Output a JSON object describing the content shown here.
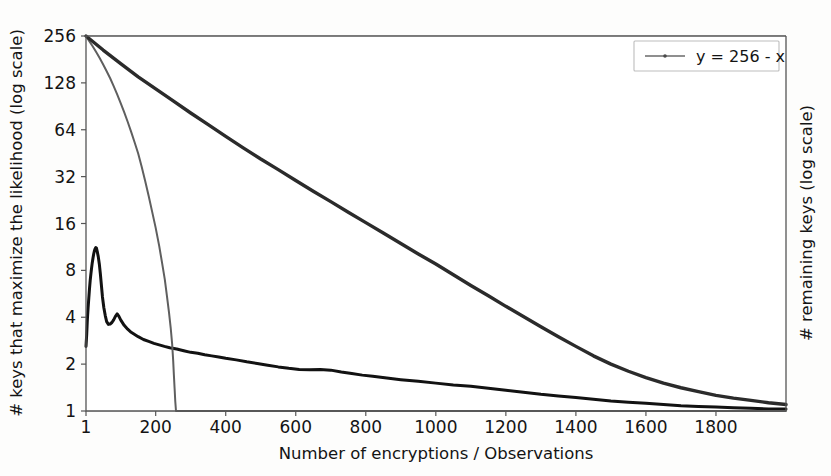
{
  "chart_data": {
    "type": "line",
    "title": "",
    "xlabel": "Number of encryptions / Observations",
    "ylabel_left": "# keys that maximize the likelihood (log scale)",
    "ylabel_right": "# remaining keys (log scale)",
    "xlim": [
      1,
      2000
    ],
    "ylim": [
      1,
      256
    ],
    "yscale": "log2",
    "xticks": [
      1,
      200,
      400,
      600,
      800,
      1000,
      1200,
      1400,
      1600,
      1800
    ],
    "xticklabels": [
      "1",
      "200",
      "400",
      "600",
      "800",
      "1000",
      "1200",
      "1400",
      "1600",
      "1800"
    ],
    "yticks": [
      1,
      2,
      4,
      8,
      16,
      32,
      64,
      128,
      256
    ],
    "yticklabels": [
      "1",
      "2",
      "4",
      "8",
      "16",
      "32",
      "64",
      "128",
      "256"
    ],
    "grid": true,
    "legend_position": "upper right",
    "legend": [
      {
        "label": "y = 256 - x",
        "color": "#6a6a6a",
        "marker": "line-with-dot"
      }
    ],
    "series": [
      {
        "name": "# keys that maximize the likelihood",
        "color": "#121212",
        "axis": "left",
        "points": [
          [
            1,
            2.6
          ],
          [
            3,
            3.1
          ],
          [
            5,
            3.9
          ],
          [
            7,
            4.6
          ],
          [
            9,
            5.3
          ],
          [
            11,
            6.1
          ],
          [
            13,
            6.9
          ],
          [
            15,
            7.6
          ],
          [
            17,
            8.3
          ],
          [
            19,
            9.0
          ],
          [
            21,
            9.6
          ],
          [
            23,
            10.2
          ],
          [
            25,
            10.7
          ],
          [
            27,
            11.0
          ],
          [
            29,
            11.2
          ],
          [
            31,
            11.1
          ],
          [
            33,
            10.6
          ],
          [
            36,
            9.8
          ],
          [
            39,
            8.8
          ],
          [
            42,
            7.6
          ],
          [
            45,
            6.4
          ],
          [
            48,
            5.4
          ],
          [
            52,
            4.6
          ],
          [
            56,
            4.1
          ],
          [
            60,
            3.75
          ],
          [
            65,
            3.6
          ],
          [
            70,
            3.62
          ],
          [
            75,
            3.7
          ],
          [
            80,
            3.85
          ],
          [
            85,
            4.05
          ],
          [
            90,
            4.2
          ],
          [
            95,
            4.05
          ],
          [
            100,
            3.85
          ],
          [
            110,
            3.55
          ],
          [
            120,
            3.35
          ],
          [
            130,
            3.2
          ],
          [
            140,
            3.1
          ],
          [
            150,
            3.0
          ],
          [
            165,
            2.88
          ],
          [
            180,
            2.8
          ],
          [
            195,
            2.72
          ],
          [
            210,
            2.66
          ],
          [
            225,
            2.6
          ],
          [
            240,
            2.55
          ],
          [
            260,
            2.5
          ],
          [
            280,
            2.44
          ],
          [
            300,
            2.38
          ],
          [
            320,
            2.35
          ],
          [
            340,
            2.3
          ],
          [
            360,
            2.26
          ],
          [
            380,
            2.22
          ],
          [
            400,
            2.18
          ],
          [
            430,
            2.13
          ],
          [
            460,
            2.07
          ],
          [
            490,
            2.02
          ],
          [
            520,
            1.97
          ],
          [
            550,
            1.92
          ],
          [
            580,
            1.88
          ],
          [
            610,
            1.85
          ],
          [
            640,
            1.84
          ],
          [
            670,
            1.85
          ],
          [
            700,
            1.83
          ],
          [
            730,
            1.78
          ],
          [
            760,
            1.74
          ],
          [
            790,
            1.7
          ],
          [
            820,
            1.67
          ],
          [
            860,
            1.63
          ],
          [
            900,
            1.59
          ],
          [
            950,
            1.55
          ],
          [
            1000,
            1.51
          ],
          [
            1050,
            1.47
          ],
          [
            1100,
            1.44
          ],
          [
            1150,
            1.4
          ],
          [
            1200,
            1.36
          ],
          [
            1250,
            1.32
          ],
          [
            1300,
            1.28
          ],
          [
            1350,
            1.25
          ],
          [
            1400,
            1.22
          ],
          [
            1450,
            1.19
          ],
          [
            1500,
            1.16
          ],
          [
            1550,
            1.14
          ],
          [
            1600,
            1.12
          ],
          [
            1650,
            1.1
          ],
          [
            1700,
            1.08
          ],
          [
            1750,
            1.07
          ],
          [
            1800,
            1.06
          ],
          [
            1850,
            1.05
          ],
          [
            1900,
            1.04
          ],
          [
            1950,
            1.03
          ],
          [
            2000,
            1.03
          ]
        ]
      },
      {
        "name": "# remaining keys",
        "color": "#6a6a6a",
        "axis": "right",
        "points": [
          [
            1,
            256
          ],
          [
            10,
            238
          ],
          [
            20,
            220
          ],
          [
            30,
            202
          ],
          [
            40,
            185
          ],
          [
            50,
            168
          ],
          [
            60,
            152
          ],
          [
            70,
            137
          ],
          [
            80,
            122
          ],
          [
            90,
            108
          ],
          [
            100,
            95
          ],
          [
            110,
            83
          ],
          [
            120,
            72
          ],
          [
            130,
            62
          ],
          [
            140,
            53
          ],
          [
            150,
            45
          ],
          [
            160,
            37
          ],
          [
            170,
            30
          ],
          [
            180,
            24
          ],
          [
            190,
            19
          ],
          [
            200,
            15
          ],
          [
            210,
            11.5
          ],
          [
            218,
            9.0
          ],
          [
            226,
            7.0
          ],
          [
            232,
            5.5
          ],
          [
            238,
            4.3
          ],
          [
            243,
            3.4
          ],
          [
            247,
            2.7
          ],
          [
            250,
            2.1
          ],
          [
            252,
            1.7
          ],
          [
            254,
            1.4
          ],
          [
            256,
            1.15
          ],
          [
            258,
            1.0
          ],
          [
            2000,
            1.0
          ]
        ]
      },
      {
        "name": "256 - x trend (dark)",
        "color": "#2b2b2b",
        "axis": "right",
        "points": [
          [
            1,
            256
          ],
          [
            50,
            208
          ],
          [
            100,
            170
          ],
          [
            150,
            140
          ],
          [
            200,
            117
          ],
          [
            250,
            98
          ],
          [
            300,
            82
          ],
          [
            350,
            69
          ],
          [
            400,
            58
          ],
          [
            450,
            49
          ],
          [
            500,
            41.5
          ],
          [
            550,
            35.5
          ],
          [
            600,
            30.2
          ],
          [
            650,
            25.8
          ],
          [
            700,
            22.1
          ],
          [
            750,
            18.9
          ],
          [
            800,
            16.2
          ],
          [
            850,
            13.9
          ],
          [
            900,
            11.9
          ],
          [
            950,
            10.2
          ],
          [
            1000,
            8.8
          ],
          [
            1050,
            7.5
          ],
          [
            1100,
            6.4
          ],
          [
            1150,
            5.5
          ],
          [
            1200,
            4.7
          ],
          [
            1250,
            4.05
          ],
          [
            1300,
            3.48
          ],
          [
            1350,
            3.0
          ],
          [
            1400,
            2.6
          ],
          [
            1450,
            2.26
          ],
          [
            1500,
            2.0
          ],
          [
            1550,
            1.8
          ],
          [
            1600,
            1.64
          ],
          [
            1650,
            1.51
          ],
          [
            1700,
            1.41
          ],
          [
            1750,
            1.33
          ],
          [
            1800,
            1.26
          ],
          [
            1850,
            1.21
          ],
          [
            1900,
            1.17
          ],
          [
            1950,
            1.13
          ],
          [
            2000,
            1.1
          ]
        ]
      }
    ]
  },
  "colors": {
    "background": "#fdfdfc",
    "grid": "#c8c8c8",
    "spine": "#555555",
    "mle_series": "#121212",
    "remaining_series": "#6a6a6a",
    "trend_series": "#2b2b2b",
    "text": "#141414"
  }
}
